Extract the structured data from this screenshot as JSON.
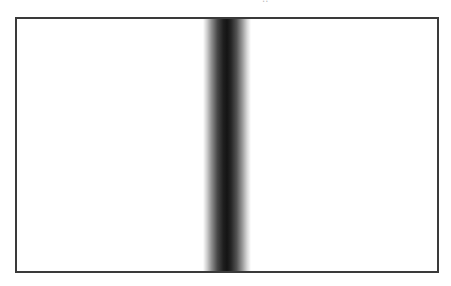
{
  "figure": {
    "title_fragment": "..",
    "frame": {
      "border_color": "#3a3a3a",
      "background": "#ffffff"
    },
    "band": {
      "orientation": "vertical",
      "center_x_px": 225,
      "left_edge_px": 203,
      "right_edge_px": 249,
      "peak_color": "#141414",
      "edge_color": "#ffffff"
    }
  }
}
